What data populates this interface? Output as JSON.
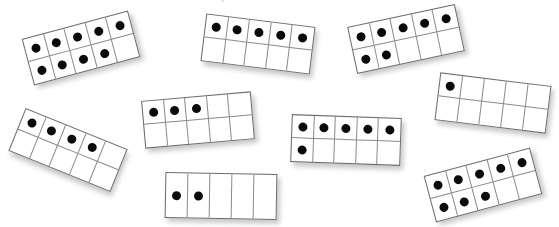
{
  "colors": {
    "dot": "#0a0a0a",
    "line": "#8a8a8a",
    "border": "#6b6b6b",
    "background": "#ffffff"
  },
  "top_glyph": "✧",
  "frames": [
    {
      "id": "frame-9",
      "rows": 2,
      "cols": 5,
      "count": 9,
      "cx": 80,
      "cy": 47,
      "w": 108,
      "h": 46,
      "rotate": -15
    },
    {
      "id": "frame-5",
      "rows": 2,
      "cols": 5,
      "count": 5,
      "cx": 257,
      "cy": 43,
      "w": 108,
      "h": 46,
      "rotate": 7
    },
    {
      "id": "frame-7",
      "rows": 2,
      "cols": 5,
      "count": 7,
      "cx": 405,
      "cy": 38,
      "w": 108,
      "h": 46,
      "rotate": -12
    },
    {
      "id": "frame-1",
      "rows": 2,
      "cols": 5,
      "count": 1,
      "cx": 492,
      "cy": 102,
      "w": 110,
      "h": 46,
      "rotate": 7
    },
    {
      "id": "frame-3",
      "rows": 2,
      "cols": 5,
      "count": 3,
      "cx": 197,
      "cy": 119,
      "w": 108,
      "h": 46,
      "rotate": -5
    },
    {
      "id": "frame-4",
      "rows": 2,
      "cols": 5,
      "count": 4,
      "cx": 67,
      "cy": 149,
      "w": 108,
      "h": 44,
      "rotate": 22
    },
    {
      "id": "frame-6",
      "rows": 2,
      "cols": 5,
      "count": 6,
      "cx": 345,
      "cy": 139,
      "w": 108,
      "h": 46,
      "rotate": 2
    },
    {
      "id": "frame-2",
      "rows": 1,
      "cols": 5,
      "count": 2,
      "cx": 220,
      "cy": 195,
      "w": 110,
      "h": 44,
      "rotate": 1
    },
    {
      "id": "frame-8",
      "rows": 2,
      "cols": 5,
      "count": 8,
      "cx": 482,
      "cy": 184,
      "w": 108,
      "h": 46,
      "rotate": -15
    }
  ]
}
